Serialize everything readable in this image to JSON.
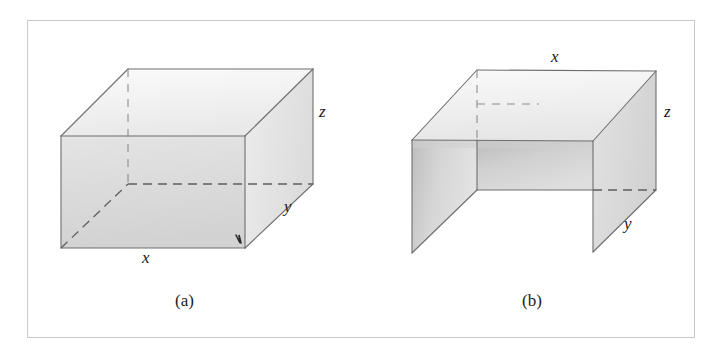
{
  "figure": {
    "border_color": "#c9c9c9",
    "background": "#ffffff",
    "line_color": "#6e6e6e",
    "panels": [
      {
        "id": "a",
        "caption": "(a)",
        "caption_x": 175,
        "caption_y": 292,
        "shape": "closed-rectangular-box",
        "labels": [
          {
            "name": "x",
            "text": "x",
            "x": 142,
            "y": 257
          },
          {
            "name": "y",
            "text": "y",
            "x": 284,
            "y": 205
          },
          {
            "name": "z",
            "text": "z",
            "x": 318,
            "y": 110
          }
        ],
        "vertices": {
          "front_top_left": [
            61,
            136
          ],
          "front_top_right": [
            245,
            136
          ],
          "front_bottom_left": [
            61,
            248
          ],
          "front_bottom_right": [
            245,
            248
          ],
          "back_top_left": [
            128,
            69
          ],
          "back_top_right": [
            313,
            69
          ],
          "back_bottom_left": [
            128,
            184
          ],
          "back_bottom_right": [
            313,
            184
          ]
        },
        "hidden_edges": [
          "back_bottom_left-back_bottom_right",
          "front_bottom_left-back_bottom_left",
          "back_top_left-back_bottom_left"
        ],
        "face_fills": {
          "top": "#f2f2f2",
          "front": "#dcdcdc",
          "right": "#e4e4e4",
          "bottom": "#bcbcbc"
        }
      },
      {
        "id": "b",
        "caption": "(b)",
        "caption_x": 490,
        "caption_y": 292,
        "shape": "open-channel-three-faces",
        "labels": [
          {
            "name": "x",
            "text": "x",
            "x": 555,
            "y": 48
          },
          {
            "name": "y",
            "text": "y",
            "x": 628,
            "y": 223
          },
          {
            "name": "z",
            "text": "z",
            "x": 668,
            "y": 110
          }
        ],
        "vertices": {
          "left_wall_front_top": [
            413,
            140
          ],
          "left_wall_front_bottom": [
            413,
            253
          ],
          "left_wall_back_top": [
            478,
            70
          ],
          "left_wall_back_bottom": [
            478,
            190
          ],
          "right_wall_front_top": [
            594,
            141
          ],
          "right_wall_front_bottom": [
            594,
            252
          ],
          "right_wall_back_top": [
            657,
            71
          ],
          "right_wall_back_bottom": [
            657,
            190
          ]
        },
        "hidden_edges": [
          "left_wall_back_top-left_wall_back_bottom",
          "right_wall_back_bottom-dashed-run"
        ],
        "face_fills": {
          "top": "#f0f0f0",
          "back": "#d4d4d4",
          "left_wall": "#d9d9d9",
          "right_wall": "#dedede"
        }
      }
    ]
  }
}
